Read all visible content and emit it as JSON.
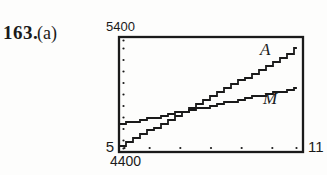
{
  "problem": {
    "number": "163.",
    "part": "(a)"
  },
  "colors": {
    "ink": "#1a1a1a",
    "paper": "#fdfdfc"
  },
  "chart_data": {
    "type": "line",
    "title": "",
    "xlabel": "",
    "ylabel": "",
    "window": {
      "xmin": 5,
      "xmax": 11,
      "ymin": 4400,
      "ymax": 5400,
      "xscl": 1,
      "yscl": 100
    },
    "grid": false,
    "tick_style": "dots",
    "legend_position": "inline-labels",
    "labels": {
      "ymax": "5400",
      "ymin": "4400",
      "xmin": "5",
      "xmax": "11"
    },
    "series": [
      {
        "name": "A",
        "points": [
          [
            5,
            4450
          ],
          [
            10.8,
            5300
          ]
        ]
      },
      {
        "name": "M",
        "points": [
          [
            5,
            4640
          ],
          [
            10.8,
            4960
          ]
        ]
      }
    ]
  }
}
